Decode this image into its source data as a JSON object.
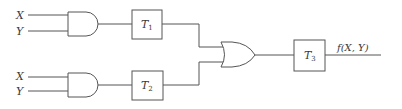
{
  "diagram": {
    "type": "logic-circuit",
    "inputs": [
      {
        "id": "x1",
        "label": "X",
        "gate": "and1"
      },
      {
        "id": "y1",
        "label": "Y",
        "gate": "and1"
      },
      {
        "id": "x2",
        "label": "X",
        "gate": "and2"
      },
      {
        "id": "y2",
        "label": "Y",
        "gate": "and2"
      }
    ],
    "gates": [
      {
        "id": "and1",
        "type": "AND"
      },
      {
        "id": "and2",
        "type": "AND"
      },
      {
        "id": "or1",
        "type": "OR"
      }
    ],
    "blocks": [
      {
        "id": "t1",
        "label": "T",
        "sub": "1"
      },
      {
        "id": "t2",
        "label": "T",
        "sub": "2"
      },
      {
        "id": "t3",
        "label": "T",
        "sub": "3"
      }
    ],
    "output": {
      "label": "f(X, Y)"
    },
    "connections": [
      [
        "X,Y",
        "and1"
      ],
      [
        "and1",
        "T1"
      ],
      [
        "T1",
        "or1"
      ],
      [
        "X,Y",
        "and2"
      ],
      [
        "and2",
        "T2"
      ],
      [
        "T2",
        "or1"
      ],
      [
        "or1",
        "T3"
      ],
      [
        "T3",
        "f(X, Y)"
      ]
    ],
    "colors": {
      "line": "#555555",
      "text": "#3a3a3a",
      "background": "#ffffff"
    }
  }
}
